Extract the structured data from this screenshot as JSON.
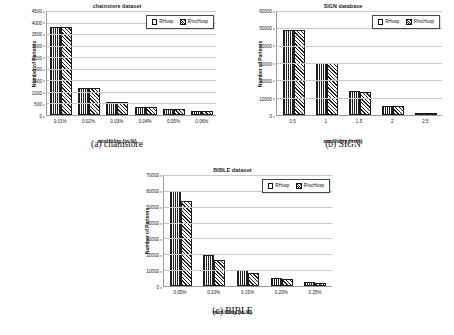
{
  "figure": {
    "panels": [
      {
        "key": "a",
        "caption": "(a) chainstore",
        "chart_data": {
          "type": "bar",
          "title": "chainstore dataset",
          "xlabel": "minUtility (in %)",
          "ylabel": "Number of Patterns",
          "categories": [
            "0.01%",
            "0.02%",
            "0.03%",
            "0.04%",
            "0.05%",
            "0.06%"
          ],
          "series": [
            {
              "name": "RHusp",
              "values": [
                3800,
                1150,
                560,
                330,
                250,
                180
              ]
            },
            {
              "name": "RIncHusp",
              "values": [
                3800,
                1150,
                560,
                330,
                250,
                180
              ]
            }
          ],
          "ylim": [
            0,
            4500
          ],
          "yticks": [
            0,
            500,
            1000,
            1500,
            2000,
            2500,
            3000,
            3500,
            4000,
            4500
          ],
          "ytick_labels": [
            "0",
            "500",
            "1000",
            "1500",
            "2000",
            "2500",
            "3000",
            "3500",
            "4000",
            "4500"
          ],
          "grid": true,
          "legend_position": "top-right"
        }
      },
      {
        "key": "b",
        "caption": "(b) SIGN",
        "chart_data": {
          "type": "bar",
          "title": "SIGN database",
          "xlabel": "minUtility (in %)",
          "ylabel": "Number of Patterns",
          "categories": [
            "0.5",
            "1",
            "1.5",
            "2",
            "2.5"
          ],
          "series": [
            {
              "name": "RHusp",
              "values": [
                49000,
                30200,
                13600,
                5400,
                800
              ]
            },
            {
              "name": "RIncHusp",
              "values": [
                49000,
                30000,
                13500,
                5300,
                800
              ]
            }
          ],
          "ylim": [
            0,
            60000
          ],
          "yticks": [
            0,
            10000,
            20000,
            30000,
            40000,
            50000,
            60000
          ],
          "ytick_labels": [
            "0",
            "10000",
            "20000",
            "30000",
            "40000",
            "50000",
            "60000"
          ],
          "grid": true,
          "legend_position": "top-right"
        }
      },
      {
        "key": "c",
        "caption": "(c) BIBLE",
        "chart_data": {
          "type": "bar",
          "title": "BIBLE dataset",
          "xlabel": "minUtility (in %)",
          "ylabel": "Number of Patterns",
          "categories": [
            "0.05%",
            "0.10%",
            "0.15%",
            "0.20%",
            "0.25%"
          ],
          "series": [
            {
              "name": "RHusp",
              "values": [
                60000,
                19500,
                10000,
                5000,
                2600
              ]
            },
            {
              "name": "RIncHusp",
              "values": [
                53500,
                16500,
                8500,
                4300,
                2200
              ]
            }
          ],
          "ylim": [
            0,
            70000
          ],
          "yticks": [
            0,
            10000,
            20000,
            30000,
            40000,
            50000,
            60000,
            70000
          ],
          "ytick_labels": [
            "0",
            "10000",
            "20000",
            "30000",
            "40000",
            "50000",
            "60000",
            "70000"
          ],
          "grid": true,
          "legend_position": "top-right"
        }
      }
    ]
  }
}
